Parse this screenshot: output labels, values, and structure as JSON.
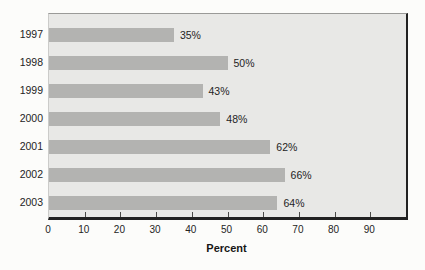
{
  "chart_data": {
    "type": "bar",
    "orientation": "horizontal",
    "categories": [
      "1997",
      "1998",
      "1999",
      "2000",
      "2001",
      "2002",
      "2003"
    ],
    "values": [
      35,
      50,
      43,
      48,
      62,
      66,
      64
    ],
    "value_labels": [
      "35%",
      "50%",
      "43%",
      "48%",
      "62%",
      "66%",
      "64%"
    ],
    "title": "",
    "xlabel": "Percent",
    "ylabel": "",
    "xlim": [
      0,
      100
    ],
    "xticks": [
      0,
      10,
      20,
      30,
      40,
      50,
      60,
      70,
      80,
      90
    ],
    "grid": false,
    "legend": false,
    "colors": {
      "bar": "#b3b3b1",
      "plot_background": "#e8e8e6",
      "page_background": "#fcfcfa",
      "axis_dark": "#212121",
      "text": "#242424"
    }
  }
}
